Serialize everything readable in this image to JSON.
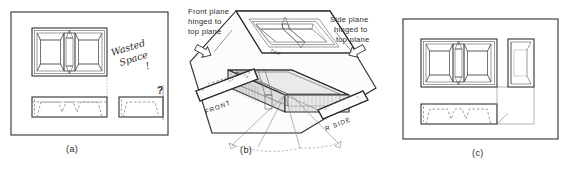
{
  "figure": {
    "panels": [
      {
        "id": "a",
        "caption": "(a)",
        "annotations": {
          "wasted_line1": "Wasted",
          "wasted_line2": "Space",
          "wasted_mark": "!",
          "question_mark": "?"
        },
        "views": [
          {
            "name": "top-view",
            "label": ""
          },
          {
            "name": "front-view",
            "label": ""
          },
          {
            "name": "side-view",
            "label": ""
          }
        ]
      },
      {
        "id": "b",
        "caption": "(b)",
        "notes": {
          "front_note": "Front plane\nhinged to\ntop plane",
          "front_note_line1": "Front plane",
          "front_note_line2": "hinged to",
          "front_note_line3": "top plane",
          "side_note_line1": "Side plane",
          "side_note_line2": "hinged to",
          "side_note_line3": "top plane"
        },
        "plane_labels": {
          "top": "TOP",
          "front": "FRONT",
          "right_side": "R SIDE"
        },
        "arrows": [
          {
            "name": "front-hinge-arrow",
            "direction": "down-right"
          },
          {
            "name": "side-hinge-arrow",
            "direction": "down-left"
          }
        ]
      },
      {
        "id": "c",
        "caption": "(c)",
        "views": [
          {
            "name": "top-view",
            "label": ""
          },
          {
            "name": "front-view",
            "label": ""
          },
          {
            "name": "side-view",
            "label": ""
          }
        ]
      }
    ],
    "colors": {
      "ink": "#3a3a3a",
      "ink_dark": "#303030",
      "hidden_line": "#6a6a6a",
      "fill_light": "#f2f2f2",
      "fill_mid": "#e9e9e9",
      "fill_dark": "#dedede",
      "background": "#ffffff"
    }
  }
}
